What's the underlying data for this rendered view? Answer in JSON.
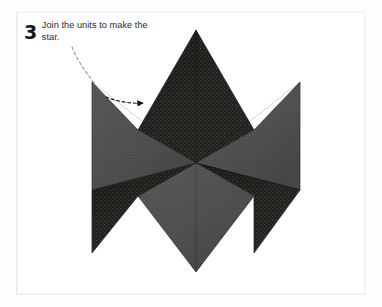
{
  "page": {
    "background_color": "#fefefe",
    "frame_color": "#f1f1f1"
  },
  "caption": {
    "step_number": "3",
    "text": "Join the units to make the star."
  },
  "figure": {
    "name": "six-pointed-star-diagram",
    "center": {
      "x": 196,
      "y": 163
    },
    "outer_radius": 133,
    "inner_radius": 67,
    "colors": {
      "dark_fabric": "#1a1a18",
      "dark_fabric_dot": "#3a3a36",
      "gray_fabric": "#4d4d4b",
      "gray_fabric_dot": "#5a5a57",
      "edge": "#121212",
      "leader_line": "#8c8c8c",
      "arrow": "#111111"
    },
    "diamonds": [
      {
        "name": "diamond-top",
        "position": "top",
        "fabric": "dark",
        "angle_deg": 90
      },
      {
        "name": "diamond-upper-right",
        "position": "upper-right",
        "fabric": "gray",
        "angle_deg": 30
      },
      {
        "name": "diamond-lower-right",
        "position": "lower-right",
        "fabric": "dark",
        "angle_deg": -30
      },
      {
        "name": "diamond-bottom",
        "position": "bottom",
        "fabric": "gray",
        "angle_deg": -90
      },
      {
        "name": "diamond-lower-left",
        "position": "lower-left",
        "fabric": "dark",
        "angle_deg": -150
      },
      {
        "name": "diamond-upper-left",
        "position": "upper-left",
        "fabric": "gray",
        "angle_deg": 150
      }
    ],
    "points": {
      "top": {
        "x": 196,
        "y": 30
      },
      "bottom": {
        "x": 196,
        "y": 272
      },
      "left": {
        "x": 92,
        "y": 190
      },
      "right": {
        "x": 300,
        "y": 190
      },
      "upper_left": {
        "x": 92,
        "y": 82
      },
      "upper_right": {
        "x": 300,
        "y": 82
      }
    }
  },
  "annotation": {
    "leader_line_style": "dashed",
    "arrow_target": "diamond-upper-left",
    "arrow_tip": {
      "x": 148,
      "y": 103
    }
  }
}
